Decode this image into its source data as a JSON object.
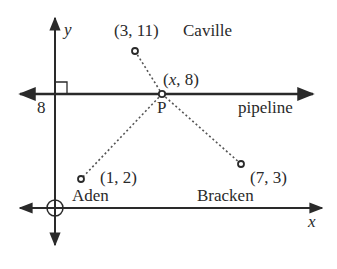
{
  "diagram": {
    "axes": {
      "x_label": "x",
      "y_label": "y"
    },
    "pipeline": {
      "label": "pipeline",
      "y_value_label": "8"
    },
    "points": [
      {
        "name": "Caville",
        "coord_label": "(3, 11)",
        "x": 3,
        "y": 11
      },
      {
        "name": "P",
        "coord_label": "(x, 8)",
        "x": "x",
        "y": 8
      },
      {
        "name": "Aden",
        "coord_label": "(1, 2)",
        "x": 1,
        "y": 2
      },
      {
        "name": "Bracken",
        "coord_label": "(7, 3)",
        "x": 7,
        "y": 3
      }
    ],
    "colors": {
      "line": "#2a2a2a",
      "dotted": "#555555",
      "background": "#ffffff"
    }
  }
}
